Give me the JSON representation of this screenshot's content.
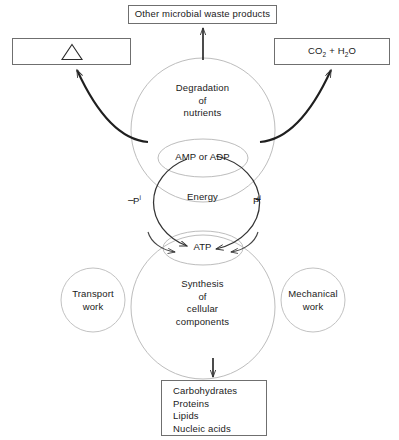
{
  "diagram": {
    "colors": {
      "outline_light": "#b8b8b8",
      "outline_dark": "#333333",
      "box_border": "#6f6f6f",
      "text": "#1a1a1a",
      "background": "#ffffff"
    }
  },
  "boxes": {
    "waste_products": {
      "label": "Other microbial waste products"
    },
    "heat": {
      "label": "",
      "symbol": "triangle",
      "symbol_name": "delta-heat-symbol"
    },
    "co2_water": {
      "label_prefix": "CO",
      "label_sub1": "2",
      "label_middle": " + H",
      "label_sub2": "2",
      "label_suffix": "O",
      "label_plain": "CO2 + H2O"
    },
    "macromolecules": {
      "lines": [
        "Carbohydrates",
        "Proteins",
        "Lipids",
        "Nucleic acids"
      ]
    }
  },
  "circles": {
    "degradation": {
      "lines": [
        "Degradation",
        "of",
        "nutrients"
      ]
    },
    "synthesis": {
      "lines": [
        "Synthesis",
        "of",
        "cellular",
        "components"
      ]
    },
    "transport_work": {
      "lines": [
        "Transport",
        "work"
      ]
    },
    "mechanical_work": {
      "lines": [
        "Mechanical",
        "work"
      ]
    }
  },
  "cycle": {
    "top_node": "AMP or ADP",
    "center_label": "Energy",
    "bottom_node": "ATP",
    "left_phosphate": {
      "sign": "–",
      "symbol": "P",
      "superscript": "i"
    },
    "right_phosphate": {
      "sign": "+",
      "symbol": "P",
      "superscript": "i"
    }
  }
}
